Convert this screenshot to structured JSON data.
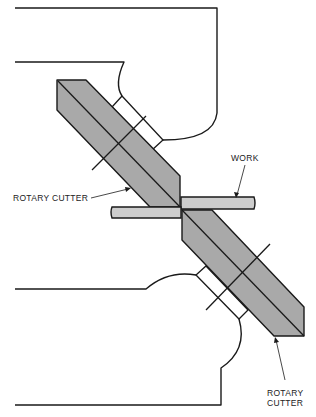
{
  "figure": {
    "labels": {
      "work": "WORK",
      "rotary_cutter_upper": "ROTARY CUTTER",
      "rotary_cutter_lower_line1": "ROTARY",
      "rotary_cutter_lower_line2": "CUTTER"
    },
    "colors": {
      "line": "#1a1a1a",
      "cutter_fill": "#a9a9a9",
      "work_fill": "#cdcdcd",
      "background": "#ffffff"
    }
  }
}
